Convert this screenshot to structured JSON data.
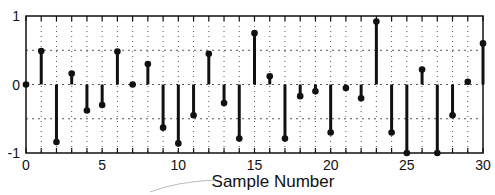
{
  "chart_data": {
    "type": "stem",
    "title": "",
    "xlabel": "Sample Number",
    "ylabel": "",
    "x": [
      0,
      1,
      2,
      3,
      4,
      5,
      6,
      7,
      8,
      9,
      10,
      11,
      12,
      13,
      14,
      15,
      16,
      17,
      18,
      19,
      20,
      21,
      22,
      23,
      24,
      25,
      26,
      27,
      28,
      29,
      30
    ],
    "values": [
      0,
      0.49,
      -0.84,
      0.16,
      -0.38,
      -0.3,
      0.48,
      0.0,
      0.3,
      -0.63,
      -0.86,
      -0.45,
      0.45,
      -0.27,
      -0.79,
      0.75,
      0.12,
      -0.79,
      -0.17,
      -0.1,
      -0.7,
      -0.05,
      -0.2,
      0.92,
      -0.7,
      -1.0,
      0.22,
      -1.0,
      -0.45,
      0.04,
      0.6
    ],
    "xlim": [
      0,
      30
    ],
    "ylim": [
      -1,
      1
    ],
    "xticks": [
      0,
      5,
      10,
      15,
      20,
      25,
      30
    ],
    "xtick_labels": [
      "0",
      "5",
      "10",
      "15",
      "20",
      "25",
      "30"
    ],
    "yticks": [
      -1,
      0,
      1
    ],
    "ytick_labels": [
      "-1",
      "0",
      "1"
    ],
    "grid": true,
    "grid_style": "dotted",
    "legend": null,
    "colors": {
      "stem": "#111111",
      "grid": "#555555",
      "axes": "#111111",
      "background": "#ffffff"
    }
  }
}
